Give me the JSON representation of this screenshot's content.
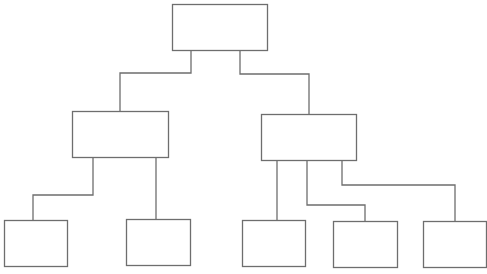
{
  "diagram": {
    "type": "org-chart-tree",
    "width": 487,
    "height": 274,
    "stroke_color": "#6e6e6e",
    "background": "#ffffff",
    "nodes": [
      {
        "id": "root",
        "label": "",
        "level": 0,
        "x": 172,
        "y": 4,
        "w": 95,
        "h": 46
      },
      {
        "id": "mid-left",
        "label": "",
        "level": 1,
        "x": 72,
        "y": 111,
        "w": 96,
        "h": 46
      },
      {
        "id": "mid-right",
        "label": "",
        "level": 1,
        "x": 261,
        "y": 114,
        "w": 95,
        "h": 46
      },
      {
        "id": "leaf-1",
        "label": "",
        "level": 2,
        "x": 4,
        "y": 220,
        "w": 63,
        "h": 46
      },
      {
        "id": "leaf-2",
        "label": "",
        "level": 2,
        "x": 126,
        "y": 219,
        "w": 64,
        "h": 46
      },
      {
        "id": "leaf-3",
        "label": "",
        "level": 2,
        "x": 242,
        "y": 220,
        "w": 63,
        "h": 46
      },
      {
        "id": "leaf-4",
        "label": "",
        "level": 2,
        "x": 333,
        "y": 221,
        "w": 64,
        "h": 46
      },
      {
        "id": "leaf-5",
        "label": "",
        "level": 2,
        "x": 423,
        "y": 221,
        "w": 63,
        "h": 46
      }
    ],
    "edges": [
      {
        "from": "root",
        "to": "mid-left",
        "points": [
          [
            191,
            50
          ],
          [
            191,
            73
          ],
          [
            120,
            73
          ],
          [
            120,
            111
          ]
        ]
      },
      {
        "from": "root",
        "to": "mid-right",
        "points": [
          [
            240,
            50
          ],
          [
            240,
            74
          ],
          [
            309,
            74
          ],
          [
            309,
            114
          ]
        ]
      },
      {
        "from": "mid-left",
        "to": "leaf-1",
        "points": [
          [
            93,
            157
          ],
          [
            93,
            195
          ],
          [
            33,
            195
          ],
          [
            33,
            220
          ]
        ]
      },
      {
        "from": "mid-left",
        "to": "leaf-2",
        "points": [
          [
            156,
            157
          ],
          [
            156,
            219
          ]
        ]
      },
      {
        "from": "mid-right",
        "to": "leaf-3",
        "points": [
          [
            277,
            160
          ],
          [
            277,
            220
          ]
        ]
      },
      {
        "from": "mid-right",
        "to": "leaf-4",
        "points": [
          [
            307,
            160
          ],
          [
            307,
            205
          ],
          [
            365,
            205
          ],
          [
            365,
            221
          ]
        ]
      },
      {
        "from": "mid-right",
        "to": "leaf-5",
        "points": [
          [
            342,
            160
          ],
          [
            342,
            185
          ],
          [
            455,
            185
          ],
          [
            455,
            221
          ]
        ]
      }
    ]
  }
}
